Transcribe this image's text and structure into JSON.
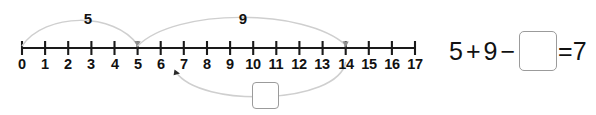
{
  "numberline": {
    "min": 0,
    "max": 17,
    "tick_labels": [
      "0",
      "1",
      "2",
      "3",
      "4",
      "5",
      "6",
      "7",
      "8",
      "9",
      "10",
      "11",
      "12",
      "13",
      "14",
      "15",
      "16",
      "17"
    ],
    "axis_color": "#1a1a1a",
    "hop_color": "#cfcfcf",
    "hops": [
      {
        "name": "hop-add-5",
        "label": "5",
        "from": 0,
        "to": 5,
        "direction": "forward",
        "side": "above",
        "label_x": 88,
        "label_y": 11
      },
      {
        "name": "hop-add-9",
        "label": "9",
        "from": 5,
        "to": 14,
        "direction": "forward",
        "side": "above",
        "label_x": 243,
        "label_y": 11
      },
      {
        "name": "hop-subtract-unknown",
        "label": "",
        "from": 14,
        "to": 7,
        "direction": "backward",
        "side": "below",
        "label_x": 0,
        "label_y": 0
      }
    ]
  },
  "equation": {
    "operand_1": "5",
    "operator_1": "+",
    "operand_2": "9",
    "operator_2": "−",
    "unknown_placeholder": "",
    "equals": "=",
    "result": "7",
    "box_border_color": "#9b9b9b"
  }
}
